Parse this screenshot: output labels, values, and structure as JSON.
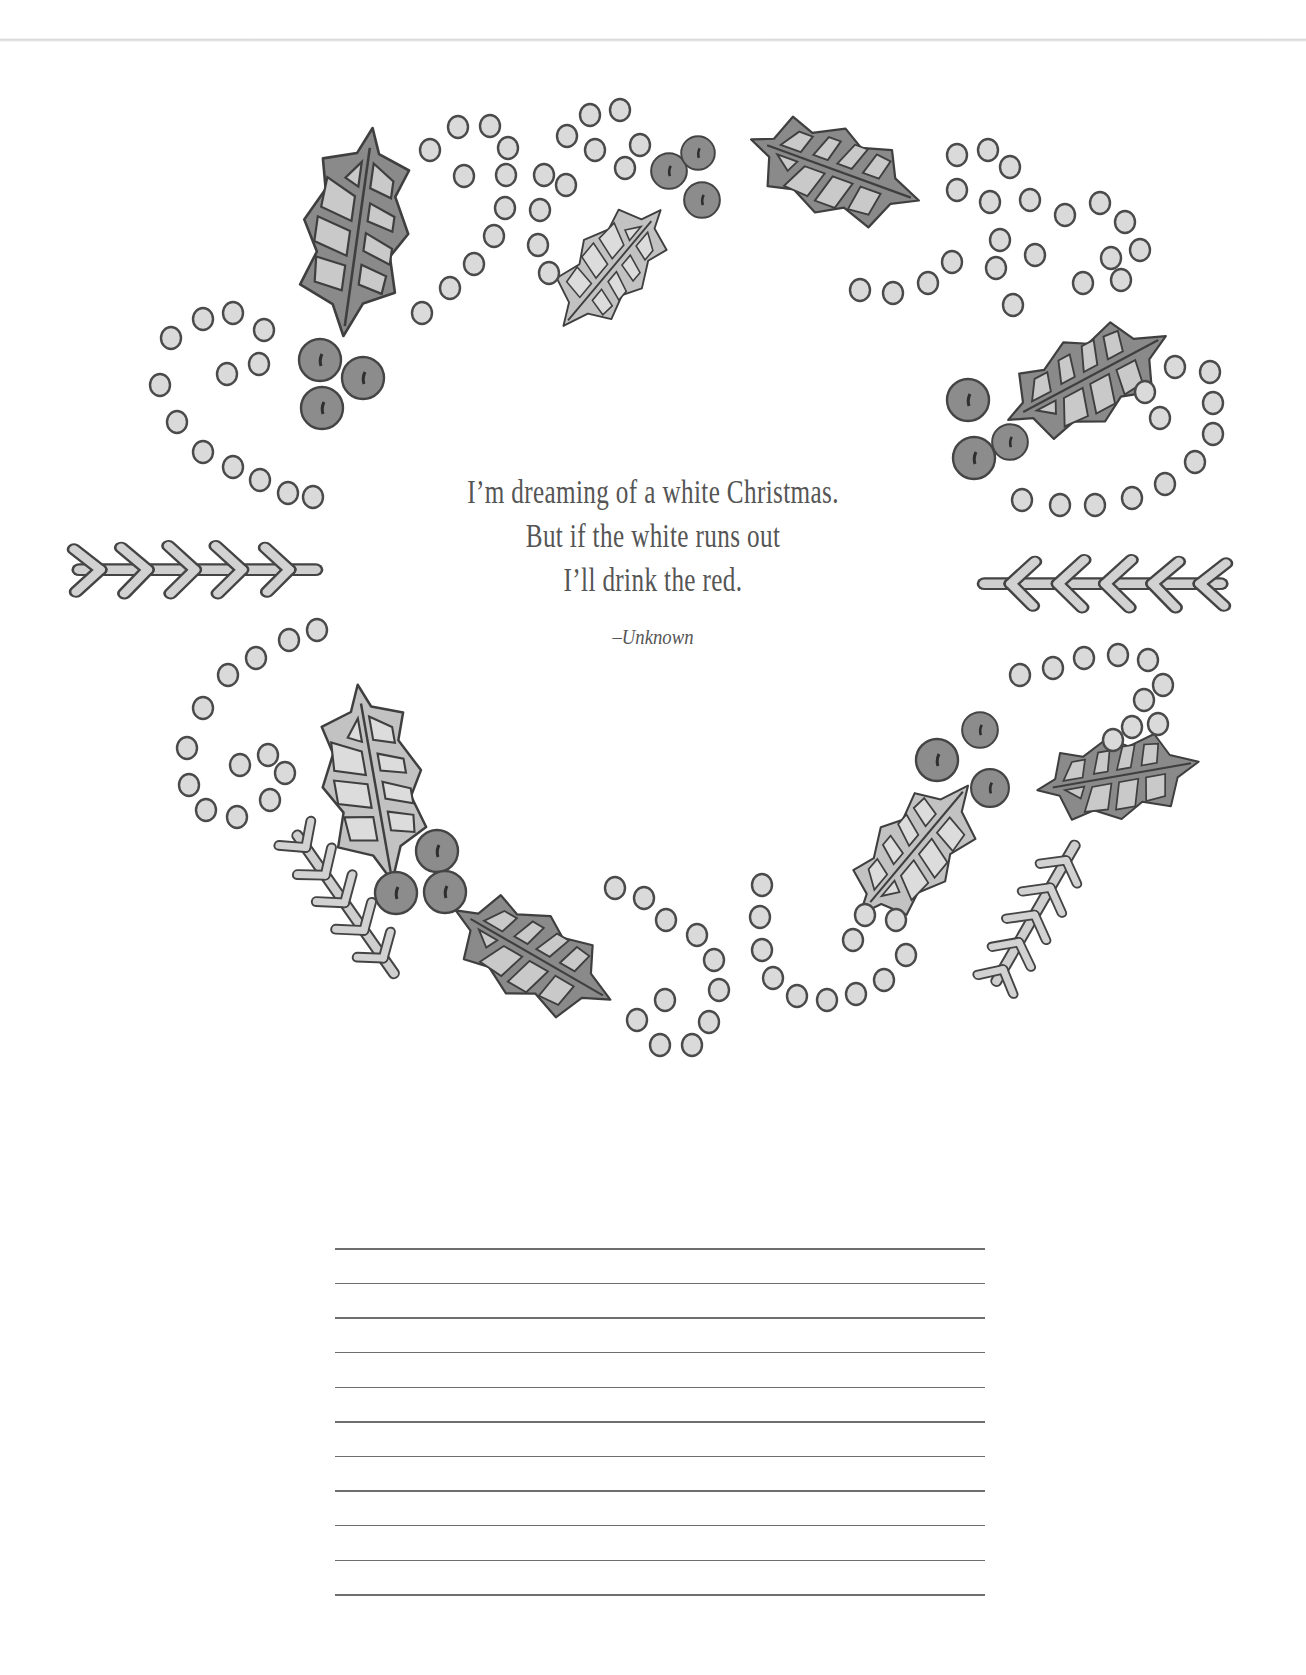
{
  "page": {
    "type": "coloring-journal-page",
    "colors": {
      "ink": "#4a4a4a",
      "leaf_dark": "#8a8a8a",
      "leaf_light": "#c9c9c9",
      "berry": "#8f8f8f",
      "dot_fill": "#d8d8d8",
      "text": "#555555",
      "rule": "#6e6e6e"
    }
  },
  "quote": {
    "lines": [
      "I’m dreaming of a white Christmas.",
      "But if the white runs out",
      "I’ll drink the red."
    ],
    "attribution": "–Unknown"
  },
  "illustration": {
    "motif": "holly-wreath",
    "elements": [
      "holly-leaf",
      "holly-berries",
      "dot-swirl",
      "fern-sprig"
    ]
  },
  "writing_area": {
    "line_count": 11
  }
}
